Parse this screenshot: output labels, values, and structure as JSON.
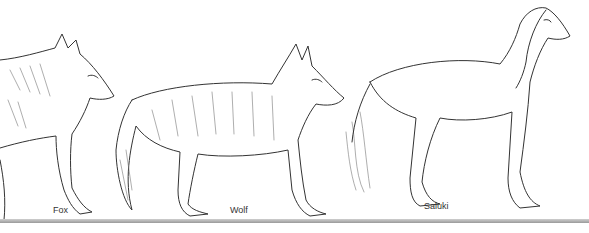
{
  "figure": {
    "animals": [
      {
        "name": "Fox",
        "label": "Fox"
      },
      {
        "name": "Wolf",
        "label": "Wolf"
      },
      {
        "name": "Saluki",
        "label": "Saluki"
      }
    ]
  }
}
